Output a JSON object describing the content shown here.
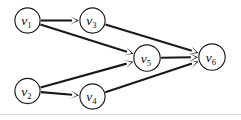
{
  "figure": {
    "type": "directed-graph",
    "width": 241,
    "height": 120,
    "background_color": "#ffffff",
    "node_fill_color": "#ffffff",
    "node_stroke_color": "#1a1a1a",
    "edge_color": "#1a1a1a",
    "label_color": "#111111",
    "frame_rule_color": "#d8d8d8"
  },
  "nodes": [
    {
      "id": "v1",
      "symbol": "v",
      "subscript": "1",
      "label": "v1",
      "cx": 27.5,
      "cy": 20.5,
      "r": 12.6
    },
    {
      "id": "v2",
      "symbol": "v",
      "subscript": "2",
      "label": "v2",
      "cx": 27.5,
      "cy": 91.0,
      "r": 12.6
    },
    {
      "id": "v3",
      "symbol": "v",
      "subscript": "3",
      "label": "v3",
      "cx": 92.5,
      "cy": 20.5,
      "r": 12.6
    },
    {
      "id": "v4",
      "symbol": "v",
      "subscript": "4",
      "label": "v4",
      "cx": 92.5,
      "cy": 96.5,
      "r": 12.6
    },
    {
      "id": "v5",
      "symbol": "v",
      "subscript": "5",
      "label": "v5",
      "cx": 147.0,
      "cy": 58.0,
      "r": 13.2
    },
    {
      "id": "v6",
      "symbol": "v",
      "subscript": "6",
      "label": "v6",
      "cx": 212.0,
      "cy": 57.0,
      "r": 13.2
    }
  ],
  "edges": [
    {
      "id": "e1",
      "from": "v1",
      "to": "v3",
      "directed": true
    },
    {
      "id": "e2",
      "from": "v1",
      "to": "v5",
      "directed": true
    },
    {
      "id": "e3",
      "from": "v3",
      "to": "v6",
      "directed": true
    },
    {
      "id": "e4",
      "from": "v2",
      "to": "v4",
      "directed": true
    },
    {
      "id": "e5",
      "from": "v2",
      "to": "v5",
      "directed": true
    },
    {
      "id": "e6",
      "from": "v4",
      "to": "v6",
      "directed": true
    },
    {
      "id": "e7",
      "from": "v5",
      "to": "v6",
      "directed": true
    }
  ]
}
